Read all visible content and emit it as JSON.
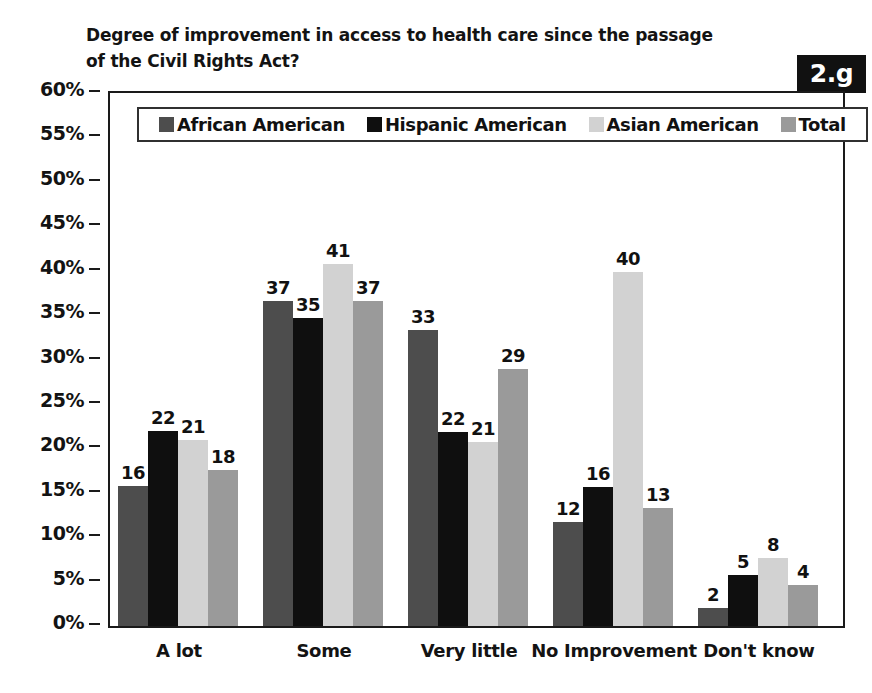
{
  "figure": {
    "badge_label": "2.g",
    "title": "Degree of improvement in access to health care since the passage\nof the Civil Rights Act?"
  },
  "chart_data": {
    "type": "bar",
    "title": "Degree of improvement in access to health care since the passage of the Civil Rights Act?",
    "xlabel": "",
    "ylabel": "",
    "ylim": [
      0,
      60
    ],
    "ytick_labels": [
      "60%",
      "55%",
      "50%",
      "45%",
      "40%",
      "35%",
      "30%",
      "25%",
      "20%",
      "15%",
      "10%",
      "5%",
      "0%"
    ],
    "ytick_values": [
      60,
      55,
      50,
      45,
      40,
      35,
      30,
      25,
      20,
      15,
      10,
      5,
      0
    ],
    "grid": false,
    "legend_position": "top-inside",
    "categories": [
      "A lot",
      "Some",
      "Very little",
      "No Improvement",
      "Don't know"
    ],
    "series": [
      {
        "name": "African American",
        "color": "#4d4d4d",
        "values": [
          16,
          37,
          33,
          12,
          2
        ],
        "plotted": [
          15.8,
          36.6,
          33.3,
          11.7,
          2.0
        ]
      },
      {
        "name": "Hispanic American",
        "color": "#0f0f0f",
        "values": [
          22,
          35,
          22,
          16,
          5
        ],
        "plotted": [
          22.0,
          34.7,
          21.8,
          15.6,
          5.7
        ]
      },
      {
        "name": "Asian American",
        "color": "#d2d2d2",
        "values": [
          21,
          41,
          21,
          40,
          8
        ],
        "plotted": [
          20.9,
          40.8,
          20.7,
          39.8,
          7.7
        ]
      },
      {
        "name": "Total",
        "color": "#9a9a9a",
        "values": [
          18,
          37,
          29,
          13,
          4
        ],
        "plotted": [
          17.6,
          36.6,
          28.9,
          13.3,
          4.6
        ]
      }
    ]
  }
}
